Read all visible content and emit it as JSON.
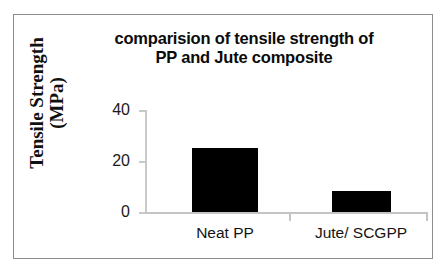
{
  "figure": {
    "border_color": "#8c8c8c",
    "background_color": "#ffffff"
  },
  "chart_data": {
    "type": "bar",
    "title": "comparision of tensile strength of PP and Jute composite",
    "title_lines": [
      "comparision of tensile strength of",
      "PP and Jute composite"
    ],
    "xlabel": "",
    "ylabel": "Tensile Strength (MPa)",
    "ylabel_lines": [
      "Tensile Strength",
      "(MPa)"
    ],
    "categories": [
      "Neat PP",
      "Jute/ SCGPP"
    ],
    "values": [
      25,
      8.2
    ],
    "ylim": [
      0,
      40
    ],
    "yticks": [
      0,
      20,
      40
    ],
    "ytick_labels": [
      "0",
      "20",
      "40"
    ],
    "grid": false,
    "legend": false,
    "bar_color": "#000000",
    "axis_color": "#c4c4c4"
  }
}
